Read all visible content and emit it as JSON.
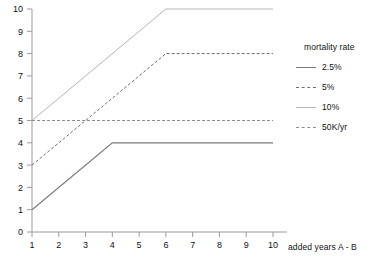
{
  "chart_data": {
    "type": "line",
    "title": "",
    "xlabel": "added years A - B",
    "ylabel": "",
    "xlim": [
      1,
      10
    ],
    "ylim": [
      0,
      10
    ],
    "xticks": [
      "1",
      "2",
      "3",
      "4",
      "5",
      "6",
      "7",
      "8",
      "9",
      "10"
    ],
    "yticks": [
      "0",
      "1",
      "2",
      "3",
      "4",
      "5",
      "6",
      "7",
      "8",
      "9",
      "10"
    ],
    "grid": false,
    "legend_position": "right",
    "legend_title": "mortality rate",
    "x": [
      1,
      2,
      3,
      4,
      5,
      6,
      7,
      8,
      9,
      10
    ],
    "series": [
      {
        "name": "2.5%",
        "style": "solid",
        "color": "#7a7a7a",
        "width": 1.2,
        "values": [
          1,
          2,
          3,
          4,
          4,
          4,
          4,
          4,
          4,
          4
        ],
        "points": [
          [
            1,
            1
          ],
          [
            4,
            4
          ],
          [
            10,
            4
          ]
        ]
      },
      {
        "name": "5%",
        "style": "dashed",
        "color": "#6e6e6e",
        "width": 1,
        "values": [
          3,
          4,
          5,
          6,
          7,
          8,
          8,
          8,
          8,
          8
        ],
        "points": [
          [
            1,
            3
          ],
          [
            6,
            8
          ],
          [
            10,
            8
          ]
        ]
      },
      {
        "name": "10%",
        "style": "solid",
        "color": "#b5b5b5",
        "width": 1,
        "values": [
          5,
          6,
          7,
          8,
          9,
          10,
          10,
          10,
          10,
          10
        ],
        "points": [
          [
            1,
            5
          ],
          [
            6,
            10
          ],
          [
            10,
            10
          ]
        ]
      },
      {
        "name": "50K/yr",
        "style": "dashed",
        "color": "#8d8d8d",
        "width": 1,
        "values": [
          5,
          5,
          5,
          5,
          5,
          5,
          5,
          5,
          5,
          5
        ],
        "points": [
          [
            1,
            5
          ],
          [
            10,
            5
          ]
        ]
      }
    ]
  }
}
